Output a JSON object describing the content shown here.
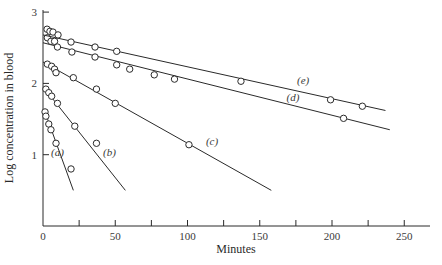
{
  "chart_data": {
    "type": "scatter",
    "title": "",
    "xlabel": "Minutes",
    "ylabel": "Log concentration in blood",
    "xlim": [
      0,
      270
    ],
    "ylim": [
      0,
      3
    ],
    "x_ticks": [
      0,
      50,
      100,
      150,
      200,
      250
    ],
    "x_minor_ticks": [
      25,
      75,
      125,
      175,
      225
    ],
    "y_ticks": [
      1,
      2,
      3
    ],
    "grid": false,
    "legend": "inline labels",
    "series": [
      {
        "name": "(a)",
        "points": [
          [
            1.4,
            1.6
          ],
          [
            2,
            1.54
          ],
          [
            4,
            1.43
          ],
          [
            5.5,
            1.35
          ],
          [
            9,
            1.16
          ],
          [
            19.4,
            0.8
          ]
        ],
        "fit_line": [
          [
            1,
            1.62
          ],
          [
            21,
            0.5
          ]
        ],
        "label_pos": [
          10,
          0.98
        ]
      },
      {
        "name": "(b)",
        "points": [
          [
            2,
            1.92
          ],
          [
            4,
            1.87
          ],
          [
            6,
            1.82
          ],
          [
            10,
            1.72
          ],
          [
            22,
            1.4
          ],
          [
            37,
            1.16
          ]
        ],
        "fit_line": [
          [
            1,
            1.93
          ],
          [
            57,
            0.5
          ]
        ],
        "label_pos": [
          46,
          0.98
        ]
      },
      {
        "name": "(c)",
        "points": [
          [
            3,
            2.27
          ],
          [
            6,
            2.24
          ],
          [
            8,
            2.2
          ],
          [
            9,
            2.15
          ],
          [
            21,
            2.08
          ],
          [
            37,
            1.92
          ],
          [
            50,
            1.72
          ],
          [
            101,
            1.14
          ]
        ],
        "fit_line": [
          [
            0,
            2.3
          ],
          [
            158,
            0.5
          ]
        ],
        "label_pos": [
          117,
          1.14
        ]
      },
      {
        "name": "(d)",
        "points": [
          [
            3,
            2.64
          ],
          [
            5.5,
            2.59
          ],
          [
            8,
            2.59
          ],
          [
            10,
            2.51
          ],
          [
            20,
            2.44
          ],
          [
            36,
            2.37
          ],
          [
            51,
            2.26
          ],
          [
            60,
            2.2
          ],
          [
            77,
            2.12
          ],
          [
            91,
            2.06
          ],
          [
            208,
            1.51
          ]
        ],
        "fit_line": [
          [
            0,
            2.57
          ],
          [
            240,
            1.35
          ]
        ],
        "label_pos": [
          173,
          1.75
        ]
      },
      {
        "name": "(e)",
        "points": [
          [
            2.8,
            2.76
          ],
          [
            4.8,
            2.73
          ],
          [
            6.9,
            2.72
          ],
          [
            10.4,
            2.68
          ],
          [
            19.4,
            2.58
          ],
          [
            36,
            2.51
          ],
          [
            51,
            2.45
          ],
          [
            137,
            2.03
          ],
          [
            199,
            1.77
          ],
          [
            221,
            1.68
          ]
        ],
        "fit_line": [
          [
            0,
            2.68
          ],
          [
            237,
            1.62
          ]
        ],
        "label_pos": [
          180,
          1.99
        ]
      }
    ]
  },
  "layout": {
    "origin_px": [
      43,
      226
    ],
    "x_px_per_unit": 1.445,
    "y_px_per_unit": 71.3,
    "x_axis_end_px": 430,
    "y_axis_top_px": 10,
    "ink_color": "#2a2a2a"
  }
}
